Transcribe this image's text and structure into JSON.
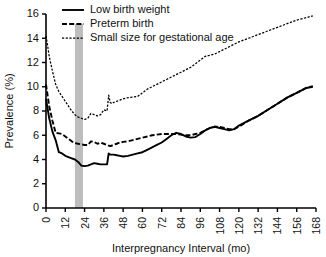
{
  "chart_data": {
    "type": "line",
    "title": "",
    "xlabel": "Interpregnancy Interval (mo)",
    "ylabel": "Prevalence (%)",
    "xlim": [
      0,
      168
    ],
    "ylim": [
      0,
      16
    ],
    "xticks": [
      0,
      12,
      24,
      36,
      48,
      60,
      72,
      84,
      96,
      108,
      120,
      132,
      144,
      156,
      168
    ],
    "yticks": [
      0,
      2,
      4,
      6,
      8,
      10,
      12,
      14,
      16
    ],
    "grid": false,
    "legend_position": "top-left",
    "annotations": [
      {
        "name": "optimal-interval-band",
        "type": "vspan",
        "x0": 18,
        "x1": 23,
        "color": "#bdbdbd"
      }
    ],
    "series": [
      {
        "name": "Low birth weight",
        "style": "solid",
        "color": "#000000",
        "x": [
          0,
          2,
          4,
          6,
          8,
          10,
          12,
          14,
          16,
          18,
          20,
          22,
          24,
          26,
          28,
          30,
          32,
          34,
          36,
          38,
          39,
          40,
          42,
          44,
          46,
          48,
          51,
          54,
          57,
          60,
          63,
          66,
          69,
          72,
          75,
          78,
          81,
          84,
          87,
          90,
          93,
          96,
          99,
          102,
          105,
          108,
          111,
          114,
          117,
          120,
          126,
          132,
          138,
          144,
          150,
          156,
          162,
          166
        ],
        "values": [
          9.0,
          7.4,
          6.3,
          5.6,
          4.6,
          4.5,
          4.3,
          4.2,
          4.1,
          4.0,
          3.8,
          3.5,
          3.45,
          3.5,
          3.6,
          3.7,
          3.65,
          3.6,
          3.6,
          3.6,
          4.5,
          4.4,
          4.4,
          4.35,
          4.3,
          4.25,
          4.3,
          4.4,
          4.5,
          4.6,
          4.8,
          5.0,
          5.2,
          5.4,
          5.7,
          6.0,
          6.2,
          6.1,
          5.9,
          5.8,
          5.85,
          6.1,
          6.4,
          6.6,
          6.7,
          6.6,
          6.5,
          6.4,
          6.5,
          6.8,
          7.2,
          7.6,
          8.1,
          8.6,
          9.1,
          9.5,
          9.9,
          10.0
        ]
      },
      {
        "name": "Preterm birth",
        "style": "dashed",
        "color": "#000000",
        "x": [
          0,
          2,
          4,
          6,
          8,
          10,
          12,
          14,
          16,
          18,
          20,
          22,
          24,
          26,
          28,
          30,
          32,
          34,
          36,
          38,
          40,
          42,
          44,
          46,
          48,
          51,
          54,
          57,
          60,
          63,
          66,
          69,
          72,
          75,
          78,
          81,
          84,
          87,
          90,
          93,
          96,
          99,
          102,
          105,
          108,
          111,
          114,
          117,
          120,
          126,
          132,
          138,
          144,
          150,
          156,
          162,
          166
        ],
        "values": [
          10.2,
          8.4,
          7.2,
          6.2,
          6.15,
          6.1,
          5.9,
          5.7,
          5.5,
          5.35,
          5.3,
          5.25,
          5.2,
          5.2,
          5.5,
          5.45,
          5.3,
          5.4,
          5.3,
          5.2,
          5.1,
          5.2,
          5.3,
          5.4,
          5.45,
          5.5,
          5.6,
          5.7,
          5.8,
          5.9,
          6.0,
          6.05,
          6.1,
          6.1,
          6.1,
          6.1,
          6.05,
          6.0,
          6.0,
          6.1,
          6.2,
          6.4,
          6.6,
          6.7,
          6.7,
          6.6,
          6.5,
          6.5,
          6.7,
          7.2,
          7.6,
          8.1,
          8.6,
          9.1,
          9.5,
          9.9,
          10.05
        ]
      },
      {
        "name": "Small size for gestational age",
        "style": "dotted",
        "color": "#000000",
        "x": [
          0,
          1,
          2,
          3,
          4,
          6,
          8,
          10,
          12,
          14,
          16,
          18,
          20,
          22,
          24,
          26,
          28,
          30,
          32,
          34,
          36,
          38,
          39,
          40,
          41,
          42,
          44,
          46,
          48,
          51,
          54,
          57,
          60,
          63,
          66,
          69,
          72,
          75,
          78,
          81,
          84,
          87,
          90,
          93,
          96,
          99,
          102,
          105,
          108,
          111,
          114,
          117,
          120,
          126,
          132,
          138,
          144,
          150,
          156,
          162,
          166
        ],
        "values": [
          14.2,
          13.4,
          12.5,
          11.9,
          11.3,
          10.2,
          9.6,
          9.2,
          8.8,
          8.4,
          8.0,
          7.7,
          7.5,
          7.4,
          7.3,
          7.4,
          7.8,
          7.7,
          7.6,
          7.7,
          8.1,
          8.0,
          9.3,
          8.7,
          8.6,
          8.7,
          8.8,
          8.9,
          9.0,
          9.1,
          9.15,
          9.2,
          9.5,
          9.8,
          10.0,
          10.2,
          10.4,
          10.6,
          10.8,
          11.0,
          11.2,
          11.4,
          11.6,
          11.9,
          12.2,
          12.5,
          12.6,
          12.7,
          12.9,
          13.1,
          13.3,
          13.5,
          13.7,
          14.0,
          14.3,
          14.6,
          14.9,
          15.2,
          15.5,
          15.7,
          15.85
        ]
      }
    ]
  },
  "legend": [
    {
      "label": "Low birth weight",
      "style": "solid"
    },
    {
      "label": "Preterm birth",
      "style": "dashed"
    },
    {
      "label": "Small size for gestational age",
      "style": "dotted"
    }
  ]
}
